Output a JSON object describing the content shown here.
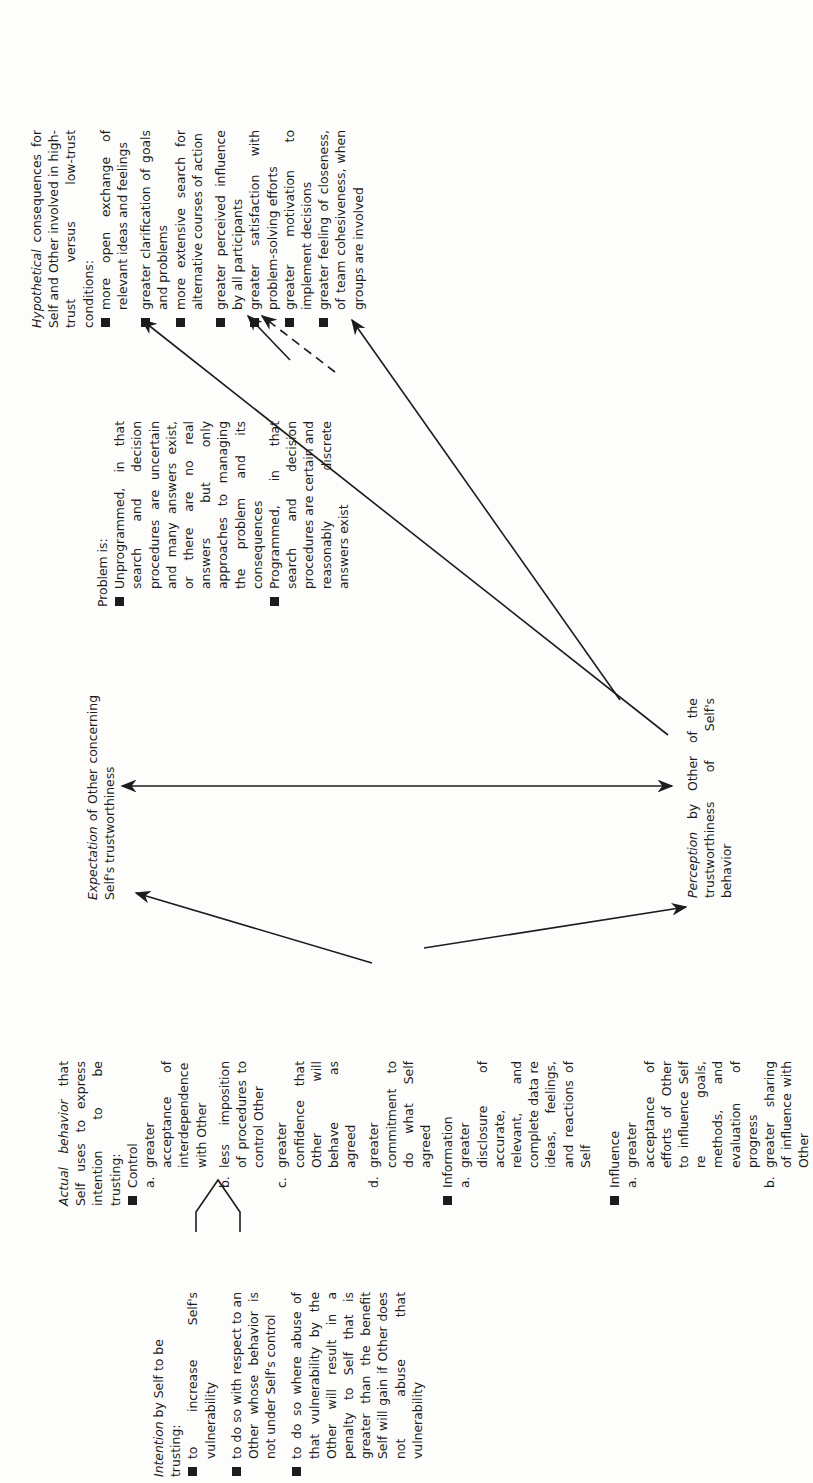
{
  "intention": {
    "title_italic": "Intention",
    "title_rest": " by Self to be trusting:",
    "items": [
      "to increase Self's vulnerability",
      "to do so with respect to an Other whose behavior is not under Self's control",
      "to do so where abuse of that vulnerability by the Other will result in a penalty to Self that is greater than the benefit Self will gain if Other does not abuse that vulnerability"
    ]
  },
  "actual_behavior": {
    "title_italic": "Actual behavior",
    "title_rest": " that Self uses to express intention to be trusting:",
    "groups": [
      {
        "label": "Control",
        "items": [
          {
            "letter": "a.",
            "text": "greater acceptance of interdependence with Other"
          },
          {
            "letter": "b.",
            "text": "less imposition of procedures to control Other"
          },
          {
            "letter": "c.",
            "text": "greater confidence that Other will behave as agreed"
          },
          {
            "letter": "d.",
            "text": "greater commitment to do what Self agreed"
          }
        ]
      },
      {
        "label": "Information",
        "items": [
          {
            "letter": "a.",
            "text": "greater disclosure of accurate, relevant, and complete data re ideas, feelings, and reactions of Self"
          }
        ]
      },
      {
        "label": "Influence",
        "items": [
          {
            "letter": "a.",
            "text": "greater acceptance of efforts of Other to influence Self re goals, methods, and evaluation of progress"
          },
          {
            "letter": "b.",
            "text": "greater sharing of influence with Other"
          }
        ]
      }
    ]
  },
  "expectation": {
    "title_italic": "Expectation",
    "title_rest": " of Other concerning Self's trustworthiness"
  },
  "perception": {
    "title_italic": "Perception",
    "title_rest": " by Other of the trustworthiness of Self's behavior"
  },
  "problem": {
    "title": "Problem is:",
    "items": [
      "Unprogrammed, in that search and decision procedures are uncertain and many answers exist, or there are no real answers but only approaches to managing the problem and its consequences",
      "Programmed, in that search and decision procedures are certain and reasonably discrete answers exist"
    ]
  },
  "consequences": {
    "title_italic": "Hypothetical",
    "title_rest": " consequences for Self and Other involved in high-trust versus low-trust conditions:",
    "items": [
      "more open exchange of relevant ideas and feelings",
      "greater clarification of goals and problems",
      "more extensive search for alternative courses of action",
      "greater perceived influence by all participants",
      "greater satisfaction with problem-solving efforts",
      "greater motivation to implement decisions",
      "greater feeling of closeness, of team cohesiveness, when groups are involved"
    ]
  },
  "connections": [
    {
      "from": "intention",
      "to": "actual_behavior",
      "style": "bracket-arrow"
    },
    {
      "from": "actual_behavior.control",
      "to": "expectation",
      "style": "solid"
    },
    {
      "from": "actual_behavior.information",
      "to": "perception",
      "style": "solid"
    },
    {
      "from": "expectation",
      "to": "perception",
      "style": "double-headed"
    },
    {
      "from": "perception",
      "to": "problem.unprogrammed",
      "style": "solid"
    },
    {
      "from": "perception",
      "to": "problem.programmed",
      "style": "solid"
    },
    {
      "from": "problem.unprogrammed",
      "to": "consequences",
      "style": "solid"
    },
    {
      "from": "problem.programmed",
      "to": "consequences",
      "style": "dashed"
    }
  ],
  "colors": {
    "ink": "#1c1c1c",
    "paper": "#fdfdfc"
  }
}
